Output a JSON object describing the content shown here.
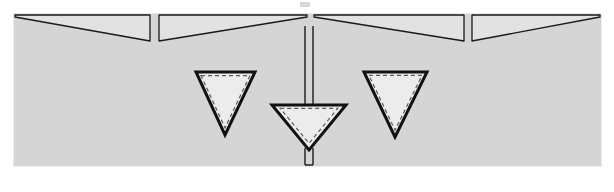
{
  "figure": {
    "title": "",
    "canvas": {
      "width": 614,
      "height": 192,
      "background_color": "#ffffff"
    },
    "slab": {
      "name": "substrate-block",
      "x": 14,
      "y": 14,
      "width": 587,
      "height": 152,
      "fill_color": "#d5d5d5",
      "stroke_color": "#d5d5d5"
    },
    "wedges": {
      "top_y": 15,
      "base_y": 41,
      "thin_edge_height": 2,
      "stroke_color": "#1a1a1a",
      "stroke_width": 1.3,
      "fill_color": "#e2e2e2",
      "items": [
        {
          "name": "wedge-1",
          "x_start": 15,
          "x_end": 150,
          "taper": "thin-to-thick",
          "label": "wedge 1"
        },
        {
          "name": "wedge-2",
          "x_start": 159,
          "x_end": 307,
          "taper": "thick-to-thin",
          "label": "wedge 2"
        },
        {
          "name": "wedge-3",
          "x_start": 314,
          "x_end": 464,
          "taper": "thin-to-thick",
          "label": "wedge 3"
        },
        {
          "name": "wedge-4",
          "x_start": 472,
          "x_end": 600,
          "taper": "thick-to-thin",
          "label": "wedge 4"
        }
      ]
    },
    "gaps": [
      {
        "name": "gap-1",
        "x": 154,
        "width": 5
      },
      {
        "name": "gap-2",
        "x": 308,
        "width": 6
      },
      {
        "name": "gap-3",
        "x": 466,
        "width": 6
      }
    ],
    "stem": {
      "name": "central-stem",
      "x_left": 305,
      "x_right": 313,
      "y_top": 26,
      "y_bottom": 105,
      "tail_y_top": 148,
      "tail_y_bottom": 165,
      "stroke_color": "#1a1a1a",
      "stroke_width": 1.4,
      "fill_color": "#d5d5d5"
    },
    "triangles": {
      "stroke_color": "#111111",
      "stroke_width": 3,
      "fill_color": "#ececec",
      "dash_stroke_color": "#5a5a5a",
      "dash_stroke_width": 1.2,
      "dash_pattern": "4 3",
      "dash_inset": 5,
      "items": [
        {
          "name": "triangle-left",
          "apex_x": 225,
          "apex_y": 135,
          "top_left_x": 196,
          "top_right_x": 255,
          "top_y": 72,
          "label": "left inclusion"
        },
        {
          "name": "triangle-center",
          "apex_x": 309,
          "apex_y": 150,
          "top_left_x": 272,
          "top_right_x": 346,
          "top_y": 105,
          "label": "center inclusion"
        },
        {
          "name": "triangle-right",
          "apex_x": 395,
          "apex_y": 137,
          "top_left_x": 364,
          "top_right_x": 427,
          "top_y": 72,
          "label": "right inclusion"
        }
      ]
    },
    "artifact": {
      "name": "scan-artifact",
      "x": 300,
      "y": 2,
      "width": 10,
      "height": 5,
      "color": "#d9d9d9"
    }
  }
}
